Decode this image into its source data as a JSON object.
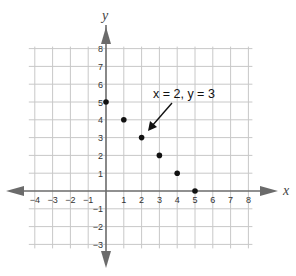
{
  "chart_data": {
    "type": "scatter",
    "title": "",
    "xlabel": "x",
    "ylabel": "y",
    "xlim": [
      -4,
      8
    ],
    "ylim": [
      -3,
      8
    ],
    "grid": true,
    "legend": null,
    "x_ticks": [
      "-4",
      "-3",
      "-2",
      "-1",
      "1",
      "2",
      "3",
      "4",
      "5",
      "6",
      "7",
      "8"
    ],
    "y_ticks": [
      "8",
      "7",
      "6",
      "5",
      "4",
      "3",
      "2",
      "1",
      "-1",
      "-2",
      "-3"
    ],
    "series": [
      {
        "name": "points",
        "points": [
          {
            "x": 0,
            "y": 5
          },
          {
            "x": 1,
            "y": 4
          },
          {
            "x": 2,
            "y": 3
          },
          {
            "x": 3,
            "y": 2
          },
          {
            "x": 4,
            "y": 1
          },
          {
            "x": 5,
            "y": 0
          }
        ]
      }
    ],
    "annotations": [
      {
        "text": "x = 2, y = 3",
        "points_to": {
          "x": 2,
          "y": 3
        }
      }
    ]
  },
  "labels": {
    "x_axis": "x",
    "y_axis": "y",
    "annotation": "x = 2, y = 3"
  },
  "colors": {
    "grid": "#c8c8c8",
    "axis": "#6b6b6b",
    "point": "#111111"
  }
}
